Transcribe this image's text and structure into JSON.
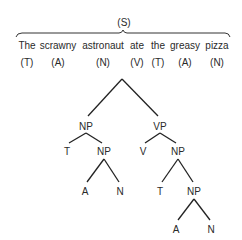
{
  "sentence": {
    "label": "(S)",
    "words": [
      {
        "text": "The",
        "tag": "(T)",
        "x": 27
      },
      {
        "text": "scrawny",
        "tag": "(A)",
        "x": 58
      },
      {
        "text": "astronaut",
        "tag": "(N)",
        "x": 103
      },
      {
        "text": "ate",
        "tag": "(V)",
        "x": 137
      },
      {
        "text": "the",
        "tag": "(T)",
        "x": 158
      },
      {
        "text": "greasy",
        "tag": "(A)",
        "x": 185
      },
      {
        "text": "pizza",
        "tag": "(N)",
        "x": 217
      }
    ]
  },
  "tree": {
    "nodes": {
      "np1": {
        "label": "NP",
        "x": 86,
        "y": 122
      },
      "vp": {
        "label": "VP",
        "x": 160,
        "y": 122
      },
      "t1": {
        "label": "T",
        "x": 67,
        "y": 147
      },
      "np2": {
        "label": "NP",
        "x": 104,
        "y": 147
      },
      "v": {
        "label": "V",
        "x": 143,
        "y": 147
      },
      "np3": {
        "label": "NP",
        "x": 178,
        "y": 147
      },
      "a1": {
        "label": "A",
        "x": 85,
        "y": 187
      },
      "n1": {
        "label": "N",
        "x": 120,
        "y": 187
      },
      "t2": {
        "label": "T",
        "x": 160,
        "y": 187
      },
      "np4": {
        "label": "NP",
        "x": 194,
        "y": 187
      },
      "a2": {
        "label": "A",
        "x": 176,
        "y": 225
      },
      "n2": {
        "label": "N",
        "x": 211,
        "y": 225
      }
    }
  }
}
